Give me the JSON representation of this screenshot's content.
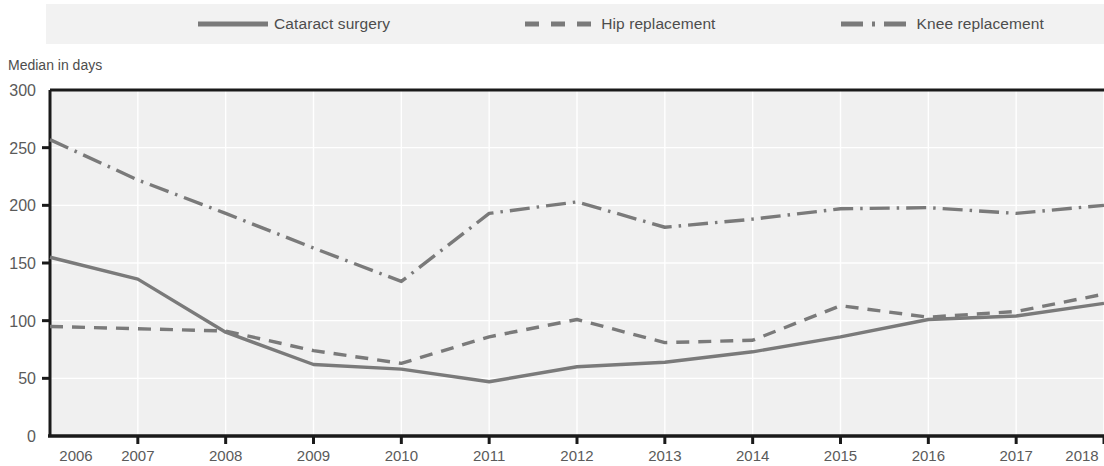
{
  "legend": {
    "items": [
      {
        "label": "Cataract surgery",
        "style": "solid",
        "icon": "solid-line-icon"
      },
      {
        "label": "Hip replacement",
        "style": "dashed",
        "icon": "dashed-line-icon"
      },
      {
        "label": "Knee replacement",
        "style": "dash-dot",
        "icon": "dash-dot-line-icon"
      }
    ]
  },
  "axis": {
    "y_title": "Median in days",
    "y_ticks": [
      "0",
      "50",
      "100",
      "150",
      "200",
      "250",
      "300"
    ],
    "x_ticks": [
      "2006",
      "2007",
      "2008",
      "2009",
      "2010",
      "2011",
      "2012",
      "2013",
      "2014",
      "2015",
      "2016",
      "2017",
      "2018"
    ]
  },
  "colors": {
    "line": "#7a7a7a",
    "plot_background": "#f0f0f0",
    "legend_background": "#f2f2f2",
    "gridline": "#ffffff",
    "frame": "#1a1a1a"
  },
  "chart_data": {
    "type": "line",
    "title": "",
    "subtitle": "",
    "xlabel": "",
    "ylabel": "Median in days",
    "x": [
      2006,
      2007,
      2008,
      2009,
      2010,
      2011,
      2012,
      2013,
      2014,
      2015,
      2016,
      2017,
      2018
    ],
    "categories": [
      "2006",
      "2007",
      "2008",
      "2009",
      "2010",
      "2011",
      "2012",
      "2013",
      "2014",
      "2015",
      "2016",
      "2017",
      "2018"
    ],
    "ylim": [
      0,
      300
    ],
    "xlim": [
      2006,
      2018
    ],
    "grid": true,
    "legend_position": "top",
    "series": [
      {
        "name": "Cataract surgery",
        "style": "solid",
        "values": [
          155,
          136,
          90,
          62,
          58,
          47,
          60,
          64,
          73,
          86,
          101,
          104,
          115
        ]
      },
      {
        "name": "Hip replacement",
        "style": "dashed",
        "values": [
          95,
          93,
          91,
          74,
          63,
          86,
          101,
          81,
          83,
          113,
          103,
          108,
          123
        ]
      },
      {
        "name": "Knee replacement",
        "style": "dash-dot",
        "values": [
          257,
          222,
          193,
          163,
          134,
          193,
          203,
          181,
          188,
          197,
          198,
          193,
          200
        ]
      }
    ]
  }
}
